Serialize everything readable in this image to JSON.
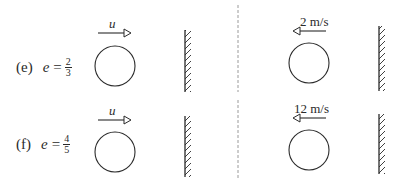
{
  "diagram": {
    "type": "collision-with-wall",
    "colors": {
      "stroke": "#2a2a2a",
      "divider": "#9a9a9a",
      "background": "#ffffff"
    },
    "rows": [
      {
        "id": "e",
        "label": "(e)",
        "coefficient_symbol": "e",
        "equals": "=",
        "coefficient": {
          "numerator": "2",
          "denominator": "3"
        },
        "left_case": {
          "velocity_label": "u",
          "direction": "right"
        },
        "right_case": {
          "velocity_label": "2 m/s",
          "direction": "left"
        }
      },
      {
        "id": "f",
        "label": "(f)",
        "coefficient_symbol": "e",
        "equals": "=",
        "coefficient": {
          "numerator": "4",
          "denominator": "5"
        },
        "left_case": {
          "velocity_label": "u",
          "direction": "right"
        },
        "right_case": {
          "velocity_label": "12 m/s",
          "direction": "left"
        }
      }
    ]
  }
}
